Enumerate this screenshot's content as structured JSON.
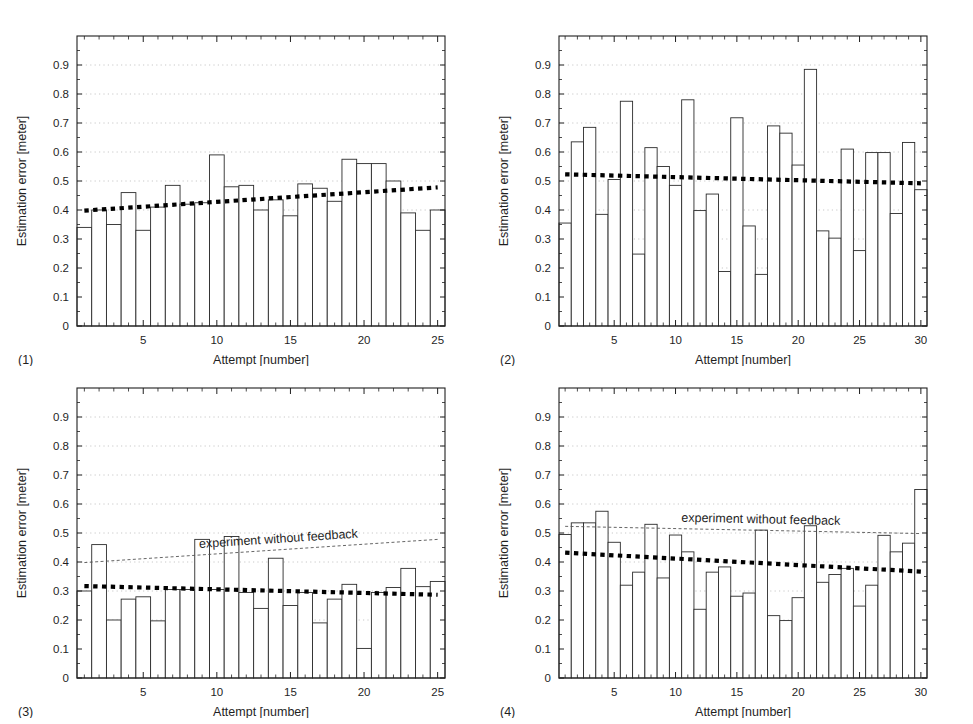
{
  "figure": {
    "width": 973,
    "height": 724,
    "background": "#ffffff",
    "ink_color": "#1f1f1f",
    "grid_color": "#bbbbbb",
    "bar_edge_color": "#2b2b2b",
    "bar_fill_color": "#ffffff",
    "trend_color": "#000000",
    "reference_color": "#555555"
  },
  "axis": {
    "ylabel": "Estimation error [meter]",
    "xlabel": "Attempt [number]",
    "yticks": [
      "0",
      "0.1",
      "0.2",
      "0.3",
      "0.4",
      "0.5",
      "0.6",
      "0.7",
      "0.8",
      "0.9"
    ],
    "ytick_values": [
      0,
      0.1,
      0.2,
      0.3,
      0.4,
      0.5,
      0.6,
      0.7,
      0.8,
      0.9
    ],
    "ylim": [
      0,
      1.0
    ],
    "grid": "horizontal-dotted"
  },
  "annotation_text": "experiment without feedback",
  "chart_data": [
    {
      "type": "bar",
      "panel_label": "(1)",
      "title": "",
      "xlabel": "Attempt [number]",
      "ylabel": "Estimation error [meter]",
      "ylim": [
        0,
        1.0
      ],
      "xlim": [
        0.5,
        25.5
      ],
      "xticks": [
        5,
        10,
        15,
        20,
        25
      ],
      "xtick_labels": [
        "5",
        "10",
        "15",
        "20",
        "25"
      ],
      "grid": true,
      "legend": "none",
      "categories": [
        1,
        2,
        3,
        4,
        5,
        6,
        7,
        8,
        9,
        10,
        11,
        12,
        13,
        14,
        15,
        16,
        17,
        18,
        19,
        20,
        21,
        22,
        23,
        24,
        25
      ],
      "values": [
        0.34,
        0.4,
        0.35,
        0.46,
        0.33,
        0.41,
        0.485,
        0.42,
        0.425,
        0.59,
        0.48,
        0.485,
        0.4,
        0.435,
        0.38,
        0.49,
        0.475,
        0.43,
        0.575,
        0.56,
        0.56,
        0.5,
        0.39,
        0.33,
        0.4
      ],
      "series": [
        {
          "name": "trend",
          "style": "thick-dotted",
          "x": [
            1,
            25
          ],
          "y": [
            0.398,
            0.478
          ]
        }
      ]
    },
    {
      "type": "bar",
      "panel_label": "(2)",
      "title": "",
      "xlabel": "Attempt [number]",
      "ylabel": "Estimation error [meter]",
      "ylim": [
        0,
        1.0
      ],
      "xlim": [
        0.5,
        30.5
      ],
      "xticks": [
        5,
        10,
        15,
        20,
        25,
        30
      ],
      "xtick_labels": [
        "5",
        "10",
        "15",
        "20",
        "25",
        "30"
      ],
      "grid": true,
      "legend": "none",
      "categories": [
        1,
        2,
        3,
        4,
        5,
        6,
        7,
        8,
        9,
        10,
        11,
        12,
        13,
        14,
        15,
        16,
        17,
        18,
        19,
        20,
        21,
        22,
        23,
        24,
        25,
        26,
        27,
        28,
        29,
        30
      ],
      "values": [
        0.355,
        0.635,
        0.685,
        0.385,
        0.505,
        0.775,
        0.248,
        0.615,
        0.55,
        0.485,
        0.78,
        0.398,
        0.455,
        0.188,
        0.718,
        0.345,
        0.178,
        0.69,
        0.665,
        0.555,
        0.885,
        0.328,
        0.303,
        0.61,
        0.26,
        0.598,
        0.598,
        0.388,
        0.633,
        0.47
      ],
      "series": [
        {
          "name": "trend",
          "style": "thick-dotted",
          "x": [
            1,
            30
          ],
          "y": [
            0.523,
            0.492
          ]
        }
      ]
    },
    {
      "type": "bar",
      "panel_label": "(3)",
      "title": "",
      "xlabel": "Attempt [number]",
      "ylabel": "Estimation error [meter]",
      "ylim": [
        0,
        1.0
      ],
      "xlim": [
        0.5,
        25.5
      ],
      "xticks": [
        5,
        10,
        15,
        20,
        25
      ],
      "xtick_labels": [
        "5",
        "10",
        "15",
        "20",
        "25"
      ],
      "grid": true,
      "legend": "none",
      "annotation": "experiment without feedback",
      "categories": [
        1,
        2,
        3,
        4,
        5,
        6,
        7,
        8,
        9,
        10,
        11,
        12,
        13,
        14,
        15,
        16,
        17,
        18,
        19,
        20,
        21,
        22,
        23,
        24,
        25
      ],
      "values": [
        0.3,
        0.46,
        0.2,
        0.272,
        0.28,
        0.197,
        0.305,
        0.305,
        0.478,
        0.305,
        0.488,
        0.295,
        0.24,
        0.413,
        0.25,
        0.295,
        0.19,
        0.272,
        0.323,
        0.102,
        0.295,
        0.312,
        0.378,
        0.315,
        0.333
      ],
      "series": [
        {
          "name": "trend",
          "style": "thick-dotted",
          "x": [
            1,
            25
          ],
          "y": [
            0.317,
            0.287
          ]
        },
        {
          "name": "experiment without feedback",
          "style": "thin-dashed",
          "x": [
            1,
            25
          ],
          "y": [
            0.398,
            0.478
          ]
        }
      ]
    },
    {
      "type": "bar",
      "panel_label": "(4)",
      "title": "",
      "xlabel": "Attempt [number]",
      "ylabel": "Estimation error [meter]",
      "ylim": [
        0,
        1.0
      ],
      "xlim": [
        0.5,
        30.5
      ],
      "xticks": [
        5,
        10,
        15,
        20,
        25,
        30
      ],
      "xtick_labels": [
        "5",
        "10",
        "15",
        "20",
        "25",
        "30"
      ],
      "grid": true,
      "legend": "none",
      "annotation": "experiment without feedback",
      "categories": [
        1,
        2,
        3,
        4,
        5,
        6,
        7,
        8,
        9,
        10,
        11,
        12,
        13,
        14,
        15,
        16,
        17,
        18,
        19,
        20,
        21,
        22,
        23,
        24,
        25,
        26,
        27,
        28,
        29,
        30
      ],
      "values": [
        0.495,
        0.535,
        0.535,
        0.575,
        0.468,
        0.32,
        0.365,
        0.53,
        0.345,
        0.493,
        0.435,
        0.237,
        0.365,
        0.383,
        0.282,
        0.293,
        0.51,
        0.215,
        0.198,
        0.277,
        0.525,
        0.33,
        0.357,
        0.378,
        0.248,
        0.32,
        0.492,
        0.435,
        0.465,
        0.65
      ],
      "series": [
        {
          "name": "trend",
          "style": "thick-dotted",
          "x": [
            1,
            30
          ],
          "y": [
            0.432,
            0.367
          ]
        },
        {
          "name": "experiment without feedback",
          "style": "thin-dashed",
          "x": [
            1,
            30
          ],
          "y": [
            0.523,
            0.498
          ]
        }
      ]
    }
  ]
}
